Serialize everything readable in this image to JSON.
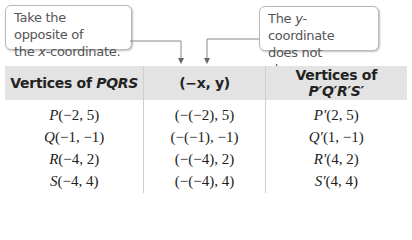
{
  "callouts": {
    "left": {
      "line1": "Take the opposite of",
      "line2_pre": "the ",
      "line2_var": "x",
      "line2_post": "-coordinate."
    },
    "right": {
      "line1_pre": "The ",
      "line1_var": "y",
      "line1_post": "-coordinate",
      "line2": "does not change."
    }
  },
  "table": {
    "headers": [
      {
        "pre": "Vertices of ",
        "var": "PQRS"
      },
      {
        "text": "(−x, y)"
      },
      {
        "pre": "Vertices of ",
        "var": "P′Q′R′S′"
      }
    ],
    "rows": [
      {
        "v": "P",
        "orig": "(−2, 5)",
        "rule": "(−(−2), 5)",
        "vp": "P′",
        "img": "(2, 5)"
      },
      {
        "v": "Q",
        "orig": "(−1, −1)",
        "rule": "(−(−1), −1)",
        "vp": "Q′",
        "img": "(1, −1)"
      },
      {
        "v": "R",
        "orig": "(−4, 2)",
        "rule": "(−(−4), 2)",
        "vp": "R′",
        "img": "(4, 2)"
      },
      {
        "v": "S",
        "orig": "(−4, 4)",
        "rule": "(−(−4), 4)",
        "vp": "S′",
        "img": "(4, 4)"
      }
    ]
  }
}
